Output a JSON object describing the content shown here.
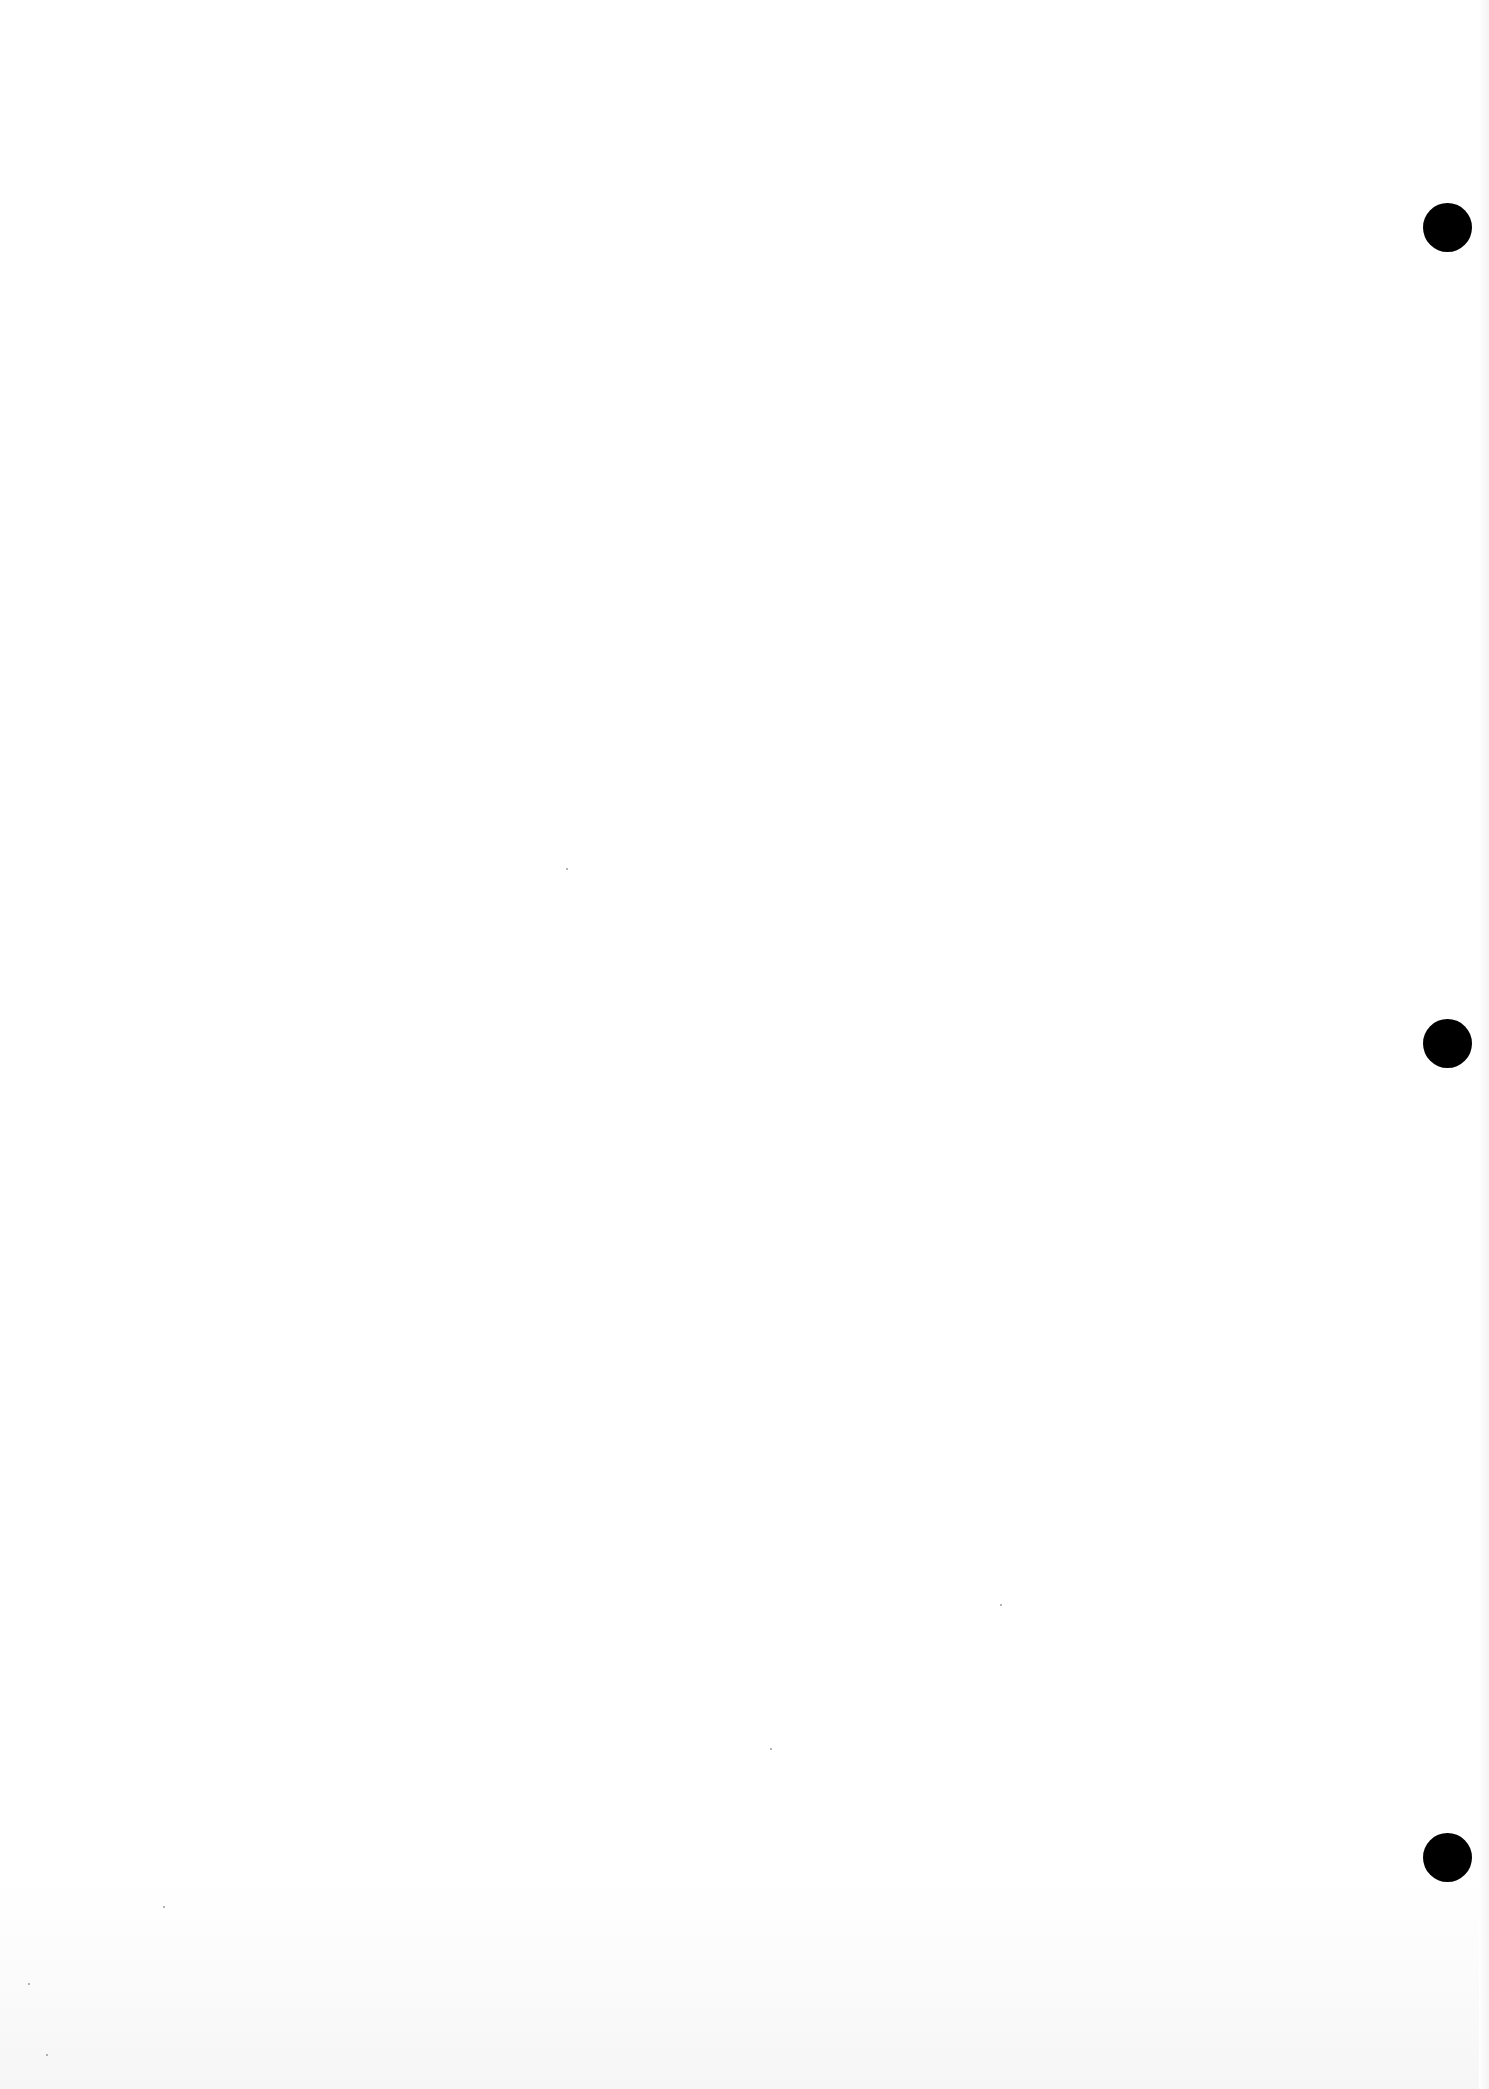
{
  "document": {
    "type": "blank scanned page",
    "text": "",
    "background_color": "#ffffff",
    "punch_hole_color": "#000000"
  },
  "punch_holes": [
    {
      "cx": 1447,
      "cy": 227,
      "d": 49
    },
    {
      "cx": 1447,
      "cy": 1043,
      "d": 49
    },
    {
      "cx": 1447,
      "cy": 1857,
      "d": 49
    }
  ]
}
